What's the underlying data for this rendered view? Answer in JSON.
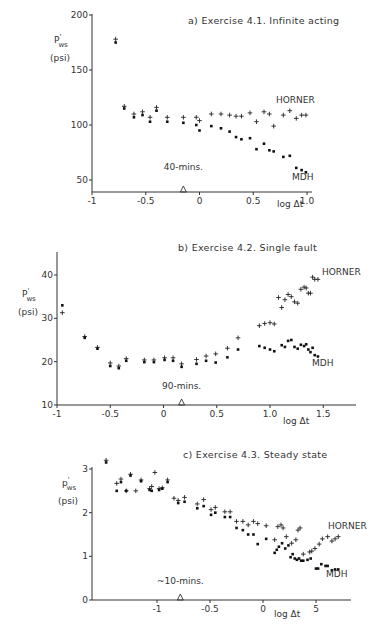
{
  "chart_data": [
    {
      "type": "scatter",
      "title": "a) Exercise 4.1. Infinite acting",
      "xlabel": "log Δt",
      "ylabel": "P'ws (psi)",
      "ylabel_main": "P",
      "ylabel_sup": "'",
      "ylabel_sub": "ws",
      "ylabel_unit": "(psi)",
      "xlim": [
        -1,
        1.0
      ],
      "ylim": [
        45,
        200
      ],
      "xticks": [
        -1,
        -0.5,
        0,
        0.5,
        1.0
      ],
      "xtick_labels": [
        "-1",
        "-0.5",
        "0",
        "0.5",
        "1.0"
      ],
      "yticks": [
        50,
        100,
        150,
        200
      ],
      "ytick_labels": [
        "50",
        "100",
        "150",
        "200"
      ],
      "annotation": {
        "text": "40-mins.",
        "x": -0.15
      },
      "series": [
        {
          "name": "HORNER",
          "marker": "plus",
          "x": [
            -0.78,
            -0.7,
            -0.61,
            -0.53,
            -0.46,
            -0.4,
            -0.3,
            -0.15,
            -0.03,
            0.0,
            0.11,
            0.2,
            0.28,
            0.34,
            0.39,
            0.47,
            0.53,
            0.6,
            0.65,
            0.69,
            0.78,
            0.84,
            0.9,
            0.95,
            0.99
          ],
          "y": [
            178,
            117,
            110,
            112,
            107,
            116,
            107,
            107,
            107,
            104,
            110,
            110,
            109,
            108,
            108,
            111,
            103,
            112,
            110,
            99,
            109,
            113,
            106,
            109,
            109
          ]
        },
        {
          "name": "MDH",
          "marker": "dot",
          "x": [
            -0.78,
            -0.7,
            -0.61,
            -0.53,
            -0.46,
            -0.4,
            -0.3,
            -0.15,
            -0.03,
            0.0,
            0.11,
            0.2,
            0.28,
            0.34,
            0.39,
            0.47,
            0.53,
            0.6,
            0.65,
            0.69,
            0.78,
            0.84,
            0.9,
            0.95,
            0.99
          ],
          "y": [
            175,
            115,
            107,
            109,
            103,
            113,
            103,
            102,
            100,
            95,
            99,
            97,
            94,
            89,
            87,
            88,
            78,
            83,
            77,
            76,
            71,
            72,
            61,
            59,
            57
          ]
        }
      ],
      "legend": [
        "HORNER",
        "MDH"
      ],
      "grid": false
    },
    {
      "type": "scatter",
      "title": "b) Exercise 4.2. Single fault",
      "xlabel": "log Δt",
      "ylabel": "P'ws (psi)",
      "ylabel_main": "P",
      "ylabel_sup": "'",
      "ylabel_sub": "ws",
      "ylabel_unit": "(psi)",
      "xlim": [
        -1,
        1.75
      ],
      "ylim": [
        10,
        45
      ],
      "xticks": [
        -1,
        -0.5,
        0,
        0.5,
        1.0,
        1.5
      ],
      "xtick_labels": [
        "-1",
        "-0.5",
        "0",
        "0.5",
        "1.0",
        "1.5"
      ],
      "yticks": [
        10,
        20,
        30,
        40
      ],
      "ytick_labels": [
        "10",
        "20",
        "30",
        "40"
      ],
      "annotation": {
        "text": "90-mins.",
        "x": 0.17
      },
      "series": [
        {
          "name": "HORNER",
          "marker": "plus",
          "x": [
            -0.95,
            -0.74,
            -0.62,
            -0.5,
            -0.42,
            -0.35,
            -0.18,
            -0.09,
            0.01,
            0.09,
            0.17,
            0.31,
            0.4,
            0.49,
            0.6,
            0.7,
            0.9,
            0.95,
            1.0,
            1.04,
            1.08,
            1.11,
            1.14,
            1.17,
            1.2,
            1.23,
            1.26,
            1.29,
            1.32,
            1.34,
            1.36,
            1.38,
            1.4,
            1.42,
            1.45
          ],
          "y": [
            31.3,
            25.8,
            23.3,
            19.7,
            19.0,
            20.7,
            20.4,
            20.4,
            20.9,
            20.9,
            19.5,
            20.5,
            21.3,
            21.8,
            23.1,
            25.5,
            28.3,
            28.8,
            29.0,
            28.7,
            34.8,
            32.5,
            34.3,
            35.5,
            35.0,
            33.8,
            33.5,
            36.7,
            37.2,
            37.0,
            35.8,
            35.8,
            39.5,
            39.0,
            39.0
          ]
        },
        {
          "name": "MDH",
          "marker": "dot",
          "x": [
            -0.95,
            -0.74,
            -0.62,
            -0.5,
            -0.42,
            -0.35,
            -0.18,
            -0.09,
            0.01,
            0.09,
            0.17,
            0.31,
            0.4,
            0.49,
            0.6,
            0.7,
            0.9,
            0.95,
            1.0,
            1.04,
            1.11,
            1.14,
            1.17,
            1.2,
            1.23,
            1.26,
            1.29,
            1.32,
            1.34,
            1.36,
            1.38,
            1.4,
            1.42,
            1.45
          ],
          "y": [
            33.0,
            25.5,
            23.0,
            19.0,
            18.5,
            20.2,
            19.9,
            19.9,
            20.4,
            20.2,
            18.8,
            19.5,
            20.2,
            19.8,
            21.0,
            22.8,
            23.6,
            23.2,
            22.8,
            22.4,
            23.8,
            23.4,
            24.8,
            25.0,
            23.4,
            23.0,
            23.9,
            23.6,
            24.0,
            22.8,
            22.2,
            23.2,
            21.5,
            21.2
          ]
        }
      ],
      "legend": [
        "HORNER",
        "MDH"
      ],
      "grid": false
    },
    {
      "type": "scatter",
      "title": "c) Exercise 4.3. Steady state",
      "xlabel": "log Δt",
      "ylabel": "p'ws (psi)",
      "ylabel_main": "p",
      "ylabel_sup": "'",
      "ylabel_sub": "ws",
      "ylabel_unit": "(psi)",
      "xlim": [
        -1.6,
        0.8
      ],
      "ylim": [
        0,
        3.1
      ],
      "xticks": [
        -1,
        -0.5,
        0,
        0.5
      ],
      "xtick_labels": [
        "-1",
        "-0.5",
        "0",
        "5"
      ],
      "yticks": [
        0,
        1,
        2,
        3
      ],
      "ytick_labels": [
        "0",
        "1",
        "2",
        "3"
      ],
      "annotation": {
        "text": "~10-mins.",
        "x": -0.78
      },
      "series": [
        {
          "name": "HORNER",
          "marker": "plus",
          "x": [
            -1.48,
            -1.38,
            -1.34,
            -1.29,
            -1.25,
            -1.2,
            -1.15,
            -1.07,
            -1.05,
            -1.02,
            -0.98,
            -0.95,
            -0.9,
            -0.84,
            -0.8,
            -0.74,
            -0.62,
            -0.56,
            -0.49,
            -0.45,
            -0.36,
            -0.31,
            -0.25,
            -0.19,
            -0.14,
            -0.09,
            -0.05,
            0.03,
            0.11,
            0.14,
            0.17,
            0.19,
            0.22,
            0.27,
            0.31,
            0.33,
            0.35,
            0.38,
            0.44,
            0.46,
            0.49,
            0.53,
            0.56,
            0.61,
            0.65,
            0.68,
            0.71
          ],
          "y": [
            3.2,
            2.67,
            2.77,
            2.5,
            2.88,
            2.5,
            2.75,
            2.55,
            2.6,
            2.92,
            2.55,
            2.57,
            2.75,
            2.33,
            2.28,
            2.35,
            2.2,
            2.3,
            2.07,
            2.12,
            2.02,
            2.02,
            1.8,
            1.8,
            1.72,
            1.8,
            1.75,
            1.7,
            1.38,
            1.68,
            1.72,
            1.65,
            1.45,
            1.3,
            1.38,
            1.6,
            1.65,
            1.05,
            1.1,
            1.12,
            1.18,
            1.28,
            1.4,
            1.45,
            1.35,
            1.4,
            1.45
          ]
        },
        {
          "name": "MDH",
          "marker": "dot",
          "x": [
            -1.48,
            -1.38,
            -1.34,
            -1.29,
            -1.25,
            -1.15,
            -1.07,
            -1.05,
            -0.98,
            -0.95,
            -0.9,
            -0.8,
            -0.74,
            -0.62,
            -0.56,
            -0.49,
            -0.45,
            -0.36,
            -0.31,
            -0.25,
            -0.19,
            -0.14,
            -0.09,
            -0.05,
            0.03,
            0.11,
            0.13,
            0.15,
            0.18,
            0.21,
            0.24,
            0.26,
            0.28,
            0.3,
            0.32,
            0.34,
            0.36,
            0.38,
            0.42,
            0.45,
            0.5,
            0.52,
            0.55,
            0.59,
            0.61,
            0.65,
            0.68,
            0.71
          ],
          "y": [
            3.15,
            2.5,
            2.7,
            2.5,
            2.85,
            2.72,
            2.52,
            2.5,
            2.52,
            2.55,
            2.7,
            2.22,
            2.25,
            2.1,
            2.15,
            1.95,
            2.0,
            1.9,
            1.9,
            1.65,
            1.6,
            1.5,
            1.5,
            1.28,
            1.4,
            1.08,
            1.15,
            1.22,
            1.3,
            1.18,
            1.25,
            0.98,
            1.05,
            0.95,
            0.92,
            0.95,
            0.9,
            0.9,
            0.92,
            0.95,
            0.72,
            0.72,
            0.82,
            0.78,
            0.78,
            0.68,
            0.7,
            0.7
          ]
        }
      ],
      "legend": [
        "HORNER",
        "MDH"
      ],
      "grid": false
    }
  ]
}
